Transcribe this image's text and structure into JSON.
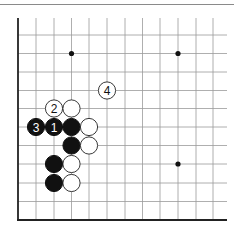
{
  "diagram": {
    "type": "go-board-partial",
    "visible_columns": 12,
    "visible_rows": 11,
    "edges": [
      "left",
      "bottom"
    ],
    "colors": {
      "black": "#111111",
      "white": "#ffffff",
      "grid": "#9a9a9a",
      "edge": "#222222"
    },
    "grid": {
      "x_lines": [
        18,
        36,
        54,
        71.5,
        89,
        107,
        125,
        142.5,
        160,
        178,
        196,
        213
      ],
      "y_lines": [
        35,
        53.5,
        72,
        90.5,
        108.5,
        127,
        145.5,
        164,
        183,
        201.5,
        220
      ],
      "x_end": 227,
      "y_start": 18
    },
    "star_points": [
      {
        "col": 3,
        "row": 1
      },
      {
        "col": 9,
        "row": 1
      },
      {
        "col": 9,
        "row": 7
      }
    ],
    "stones": [
      {
        "color": "white",
        "col": 5,
        "row": 3,
        "label": "4"
      },
      {
        "color": "white",
        "col": 2,
        "row": 4,
        "label": "2"
      },
      {
        "color": "white",
        "col": 3,
        "row": 4,
        "label": ""
      },
      {
        "color": "black",
        "col": 1,
        "row": 5,
        "label": "3"
      },
      {
        "color": "black",
        "col": 2,
        "row": 5,
        "label": "1"
      },
      {
        "color": "black",
        "col": 3,
        "row": 5,
        "label": ""
      },
      {
        "color": "white",
        "col": 4,
        "row": 5,
        "label": ""
      },
      {
        "color": "black",
        "col": 3,
        "row": 6,
        "label": ""
      },
      {
        "color": "white",
        "col": 4,
        "row": 6,
        "label": ""
      },
      {
        "color": "black",
        "col": 2,
        "row": 7,
        "label": ""
      },
      {
        "color": "white",
        "col": 3,
        "row": 7,
        "label": ""
      },
      {
        "color": "black",
        "col": 2,
        "row": 8,
        "label": ""
      },
      {
        "color": "white",
        "col": 3,
        "row": 8,
        "label": ""
      }
    ]
  }
}
